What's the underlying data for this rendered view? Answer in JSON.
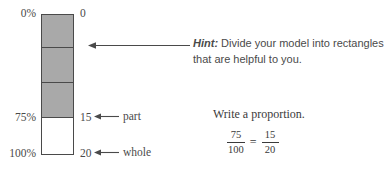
{
  "bar_model": {
    "percent_labels": [
      {
        "text": "0%",
        "position": "top"
      },
      {
        "text": "75%",
        "position": "shaded-end"
      },
      {
        "text": "100%",
        "position": "bottom"
      }
    ],
    "value_labels": [
      {
        "text": "0",
        "position": "top"
      },
      {
        "text": "15",
        "position": "shaded-end"
      },
      {
        "text": "20",
        "position": "bottom"
      }
    ],
    "annotations": [
      {
        "label": "part",
        "points_to": "15"
      },
      {
        "label": "whole",
        "points_to": "20"
      }
    ],
    "segments": [
      {
        "shaded": true
      },
      {
        "shaded": true
      },
      {
        "shaded": true
      },
      {
        "shaded": false
      }
    ],
    "shaded_color": "#a9a9a9",
    "empty_color": "#ffffff",
    "outline_color": "#4a4a4a"
  },
  "hint": {
    "lead": "Hint:",
    "body": " Divide your model into rectangles that are helpful to you."
  },
  "proportion": {
    "title": "Write a proportion.",
    "left_fraction": {
      "numerator": "75",
      "denominator": "100"
    },
    "operator": "=",
    "right_fraction": {
      "numerator": "15",
      "denominator": "20"
    }
  }
}
